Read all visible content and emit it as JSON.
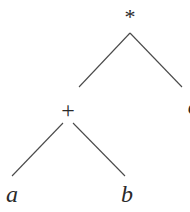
{
  "diagram": {
    "type": "expression-tree",
    "nodes": {
      "root": {
        "label": "*"
      },
      "plus": {
        "label": "+"
      },
      "a": {
        "label": "a"
      },
      "b": {
        "label": "b"
      },
      "c": {
        "label": "c"
      }
    },
    "edges": [
      {
        "from": "*",
        "to": "+"
      },
      {
        "from": "*",
        "to": "c"
      },
      {
        "from": "+",
        "to": "a"
      },
      {
        "from": "+",
        "to": "b"
      }
    ],
    "colors": {
      "line": "#4a4a4a",
      "text": "#2a2a2a",
      "background": "#ffffff"
    }
  }
}
